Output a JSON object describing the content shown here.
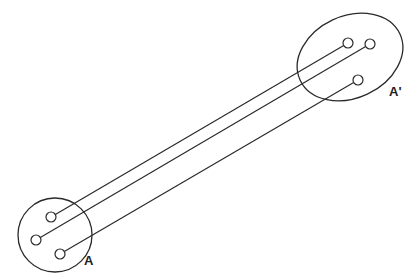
{
  "labels": {
    "source": "A",
    "target": "A'"
  },
  "colors": {
    "stroke": "#2a2a2a",
    "background": "#ffffff"
  },
  "source_region": {
    "shape": "circle",
    "cx": 55,
    "cy": 235,
    "r": 37
  },
  "target_region": {
    "shape": "ellipse",
    "cx": 350,
    "cy": 57,
    "rx": 55,
    "ry": 41,
    "rotate": -25
  },
  "points": {
    "source": [
      {
        "x": 51,
        "y": 217
      },
      {
        "x": 36,
        "y": 240
      },
      {
        "x": 60,
        "y": 254
      }
    ],
    "target": [
      {
        "x": 348,
        "y": 43
      },
      {
        "x": 370,
        "y": 44
      },
      {
        "x": 358,
        "y": 80
      }
    ]
  },
  "connections": [
    [
      0,
      0
    ],
    [
      1,
      1
    ],
    [
      2,
      2
    ]
  ]
}
